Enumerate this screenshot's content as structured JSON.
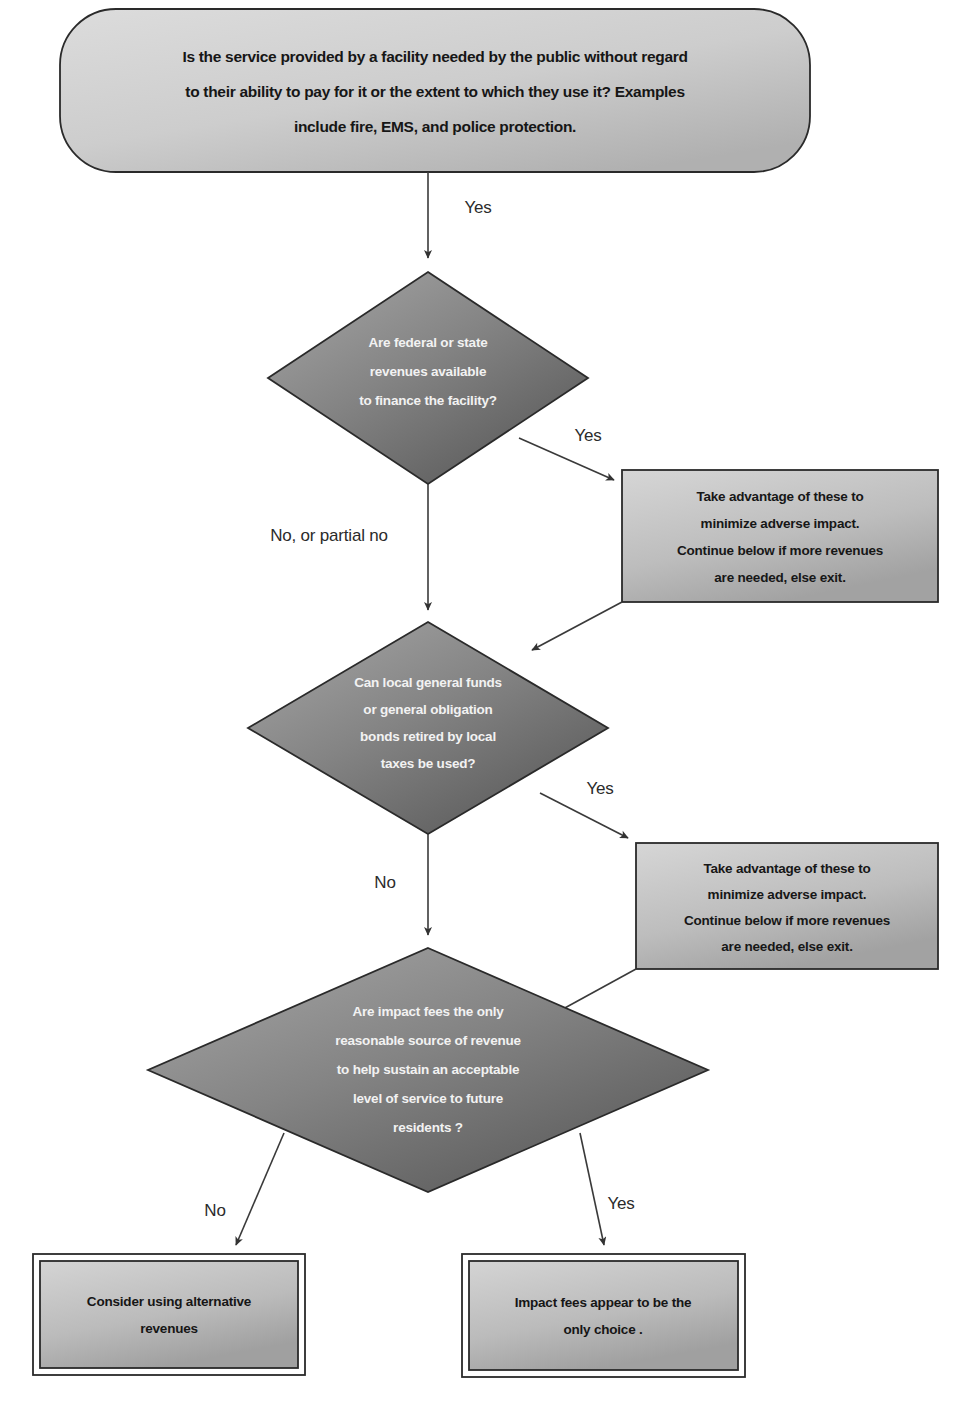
{
  "diagram": {
    "caption": "",
    "colors": {
      "terminal_fill_light": "#d8d8d8",
      "terminal_fill_dark": "#b4b4b4",
      "decision_fill_light": "#9d9d9d",
      "decision_fill_dark": "#5c5c5c",
      "process_fill_light": "#d2d2d2",
      "process_fill_dark": "#a8a8a8",
      "result_fill_light": "#cfcfcf",
      "result_fill_dark": "#a5a5a5",
      "outline": "#2a2a2a",
      "line": "#3a3a3a",
      "decision_label": "#f2f2f2",
      "background": "#ffffff"
    },
    "nodes": {
      "start": {
        "id": "start",
        "shape": "rounded-rectangle",
        "lines": [
          "Is the service provided by a facility needed by the public without regard",
          "to their ability to pay for it or the extent to which they use it?  Examples",
          "include fire, EMS, and police protection."
        ]
      },
      "decision1": {
        "id": "decision1",
        "shape": "diamond",
        "lines": [
          "Are federal or state",
          "revenues available",
          "to finance the facility?"
        ]
      },
      "process1": {
        "id": "process1",
        "shape": "rectangle",
        "lines": [
          "Take advantage of these to",
          "minimize adverse impact.",
          "Continue below if more revenues",
          "are needed, else exit."
        ]
      },
      "decision2": {
        "id": "decision2",
        "shape": "diamond",
        "lines": [
          "Can local general funds",
          "or general obligation",
          "bonds retired by local",
          "taxes be used?"
        ]
      },
      "process2": {
        "id": "process2",
        "shape": "rectangle",
        "lines": [
          "Take advantage of these to",
          "minimize adverse impact.",
          "Continue below if more revenues",
          "are needed, else exit."
        ]
      },
      "decision3": {
        "id": "decision3",
        "shape": "diamond",
        "lines": [
          "Are impact fees the only",
          "reasonable source of revenue",
          "to help sustain an acceptable",
          "level of service to future",
          "residents ?"
        ]
      },
      "result_left": {
        "id": "result_left",
        "shape": "double-rectangle",
        "lines": [
          "Consider using alternative",
          "revenues"
        ]
      },
      "result_right": {
        "id": "result_right",
        "shape": "double-rectangle",
        "lines": [
          "Impact fees appear to be the",
          "only choice ."
        ]
      }
    },
    "edges": [
      {
        "id": "e1",
        "from": "start",
        "to": "decision1",
        "label": "Yes"
      },
      {
        "id": "e2",
        "from": "decision1",
        "to": "process1",
        "label": "Yes"
      },
      {
        "id": "e3",
        "from": "decision1",
        "to": "decision2",
        "label": "No, or partial no"
      },
      {
        "id": "e4",
        "from": "process1",
        "to": "decision2",
        "label": ""
      },
      {
        "id": "e5",
        "from": "decision2",
        "to": "process2",
        "label": "Yes"
      },
      {
        "id": "e6",
        "from": "decision2",
        "to": "decision3",
        "label": "No"
      },
      {
        "id": "e7",
        "from": "process2",
        "to": "decision3",
        "label": ""
      },
      {
        "id": "e8",
        "from": "decision3",
        "to": "result_left",
        "label": "No"
      },
      {
        "id": "e9",
        "from": "decision3",
        "to": "result_right",
        "label": "Yes"
      }
    ]
  }
}
